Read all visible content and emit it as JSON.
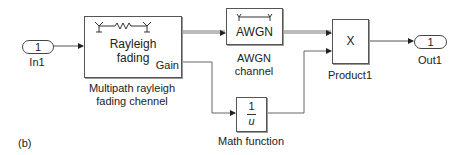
{
  "figure_label": "(b)",
  "blocks": {
    "in1": {
      "value": "1",
      "label": "In1"
    },
    "rayleigh": {
      "line1": "Rayleigh",
      "line2": "fading",
      "port": "Gain",
      "label1": "Multipath rayleigh",
      "label2": "fading chennel"
    },
    "awgn": {
      "text": "AWGN",
      "label1": "AWGN",
      "label2": "channel"
    },
    "product": {
      "text": "X",
      "label": "Product1"
    },
    "out1": {
      "value": "1",
      "label": "Out1"
    },
    "math": {
      "num": "1",
      "den": "u",
      "label": "Math function"
    }
  }
}
